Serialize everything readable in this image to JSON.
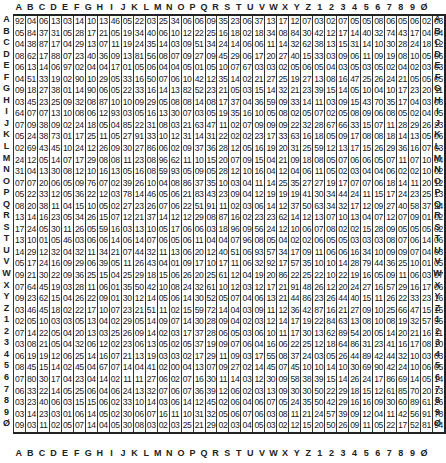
{
  "labels": [
    "A",
    "B",
    "C",
    "D",
    "E",
    "F",
    "G",
    "H",
    "I",
    "J",
    "K",
    "L",
    "M",
    "N",
    "O",
    "P",
    "Q",
    "R",
    "S",
    "T",
    "U",
    "V",
    "W",
    "X",
    "Y",
    "Z",
    "1",
    "2",
    "3",
    "4",
    "5",
    "6",
    "7",
    "8",
    "9",
    "Ø"
  ],
  "rows": [
    [
      "92",
      "04",
      "06",
      "13",
      "03",
      "14",
      "10",
      "13",
      "46",
      "05",
      "22",
      "03",
      "25",
      "34",
      "06",
      "06",
      "09",
      "35",
      "23",
      "06",
      "37",
      "13",
      "17",
      "12",
      "07",
      "03",
      "02",
      "07",
      "05",
      "05",
      "08",
      "06",
      "05",
      "06",
      "02",
      "03"
    ],
    [
      "05",
      "84",
      "37",
      "31",
      "05",
      "28",
      "17",
      "21",
      "05",
      "19",
      "34",
      "40",
      "06",
      "10",
      "12",
      "22",
      "25",
      "16",
      "18",
      "02",
      "18",
      "34",
      "08",
      "84",
      "30",
      "42",
      "12",
      "17",
      "14",
      "40",
      "32",
      "74",
      "43",
      "17",
      "04",
      "04"
    ],
    [
      "04",
      "38",
      "87",
      "17",
      "04",
      "29",
      "13",
      "07",
      "11",
      "19",
      "24",
      "35",
      "14",
      "03",
      "09",
      "51",
      "34",
      "24",
      "14",
      "06",
      "06",
      "11",
      "14",
      "32",
      "62",
      "38",
      "13",
      "15",
      "31",
      "14",
      "10",
      "30",
      "28",
      "24",
      "18",
      "12"
    ],
    [
      "08",
      "62",
      "17",
      "88",
      "07",
      "23",
      "40",
      "36",
      "09",
      "13",
      "81",
      "56",
      "08",
      "07",
      "09",
      "27",
      "09",
      "45",
      "29",
      "06",
      "17",
      "20",
      "27",
      "40",
      "15",
      "33",
      "03",
      "09",
      "06",
      "11",
      "09",
      "19",
      "08",
      "10",
      "05",
      "06"
    ],
    [
      "06",
      "13",
      "14",
      "06",
      "97",
      "02",
      "04",
      "04",
      "17",
      "01",
      "05",
      "06",
      "04",
      "04",
      "05",
      "01",
      "05",
      "10",
      "07",
      "67",
      "03",
      "03",
      "02",
      "05",
      "06",
      "05",
      "04",
      "03",
      "05",
      "03",
      "05",
      "02",
      "04",
      "02",
      "03",
      "03"
    ],
    [
      "04",
      "51",
      "33",
      "19",
      "02",
      "90",
      "10",
      "29",
      "05",
      "33",
      "16",
      "50",
      "07",
      "06",
      "10",
      "42",
      "12",
      "35",
      "14",
      "02",
      "21",
      "27",
      "25",
      "19",
      "27",
      "13",
      "08",
      "16",
      "47",
      "25",
      "26",
      "24",
      "21",
      "05",
      "05",
      "05"
    ],
    [
      "09",
      "18",
      "27",
      "38",
      "01",
      "14",
      "90",
      "06",
      "05",
      "22",
      "33",
      "16",
      "14",
      "13",
      "82",
      "52",
      "23",
      "21",
      "05",
      "03",
      "15",
      "14",
      "32",
      "21",
      "23",
      "39",
      "15",
      "14",
      "05",
      "10",
      "04",
      "10",
      "17",
      "23",
      "20",
      "11"
    ],
    [
      "03",
      "45",
      "23",
      "25",
      "09",
      "32",
      "08",
      "87",
      "10",
      "10",
      "09",
      "29",
      "05",
      "08",
      "08",
      "14",
      "08",
      "17",
      "37",
      "04",
      "36",
      "59",
      "09",
      "33",
      "14",
      "11",
      "03",
      "09",
      "15",
      "43",
      "70",
      "35",
      "17",
      "04",
      "03",
      "03"
    ],
    [
      "64",
      "07",
      "07",
      "13",
      "10",
      "08",
      "06",
      "12",
      "93",
      "03",
      "05",
      "16",
      "13",
      "30",
      "07",
      "03",
      "05",
      "19",
      "35",
      "16",
      "10",
      "05",
      "08",
      "02",
      "05",
      "07",
      "02",
      "05",
      "08",
      "09",
      "06",
      "08",
      "05",
      "02",
      "04",
      "05"
    ],
    [
      "07",
      "09",
      "38",
      "09",
      "02",
      "24",
      "18",
      "05",
      "04",
      "85",
      "22",
      "31",
      "08",
      "03",
      "21",
      "63",
      "47",
      "11",
      "02",
      "07",
      "09",
      "09",
      "09",
      "22",
      "32",
      "28",
      "67",
      "66",
      "33",
      "15",
      "07",
      "11",
      "28",
      "29",
      "26",
      "23"
    ],
    [
      "05",
      "24",
      "38",
      "73",
      "01",
      "17",
      "25",
      "11",
      "05",
      "27",
      "91",
      "33",
      "10",
      "12",
      "31",
      "14",
      "31",
      "22",
      "02",
      "02",
      "23",
      "17",
      "33",
      "63",
      "16",
      "18",
      "05",
      "09",
      "17",
      "08",
      "08",
      "18",
      "14",
      "13",
      "05",
      "06"
    ],
    [
      "02",
      "69",
      "43",
      "45",
      "10",
      "24",
      "12",
      "26",
      "09",
      "30",
      "27",
      "86",
      "06",
      "02",
      "09",
      "37",
      "36",
      "28",
      "12",
      "05",
      "16",
      "19",
      "20",
      "31",
      "25",
      "59",
      "12",
      "13",
      "17",
      "15",
      "26",
      "29",
      "36",
      "16",
      "07",
      "03"
    ],
    [
      "24",
      "12",
      "05",
      "14",
      "07",
      "17",
      "29",
      "08",
      "08",
      "11",
      "23",
      "08",
      "96",
      "62",
      "11",
      "10",
      "15",
      "20",
      "07",
      "09",
      "15",
      "04",
      "21",
      "09",
      "18",
      "08",
      "05",
      "07",
      "06",
      "06",
      "05",
      "07",
      "11",
      "07",
      "10",
      "04"
    ],
    [
      "31",
      "04",
      "13",
      "30",
      "08",
      "12",
      "10",
      "16",
      "13",
      "05",
      "16",
      "08",
      "59",
      "93",
      "05",
      "09",
      "05",
      "28",
      "12",
      "10",
      "16",
      "04",
      "12",
      "04",
      "06",
      "11",
      "05",
      "02",
      "03",
      "04",
      "04",
      "06",
      "02",
      "02",
      "10",
      "02"
    ],
    [
      "07",
      "07",
      "20",
      "06",
      "05",
      "09",
      "76",
      "07",
      "02",
      "39",
      "26",
      "10",
      "04",
      "08",
      "86",
      "37",
      "35",
      "10",
      "03",
      "04",
      "11",
      "14",
      "25",
      "35",
      "27",
      "27",
      "19",
      "17",
      "07",
      "07",
      "06",
      "18",
      "14",
      "11",
      "20",
      "12"
    ],
    [
      "05",
      "22",
      "33",
      "12",
      "05",
      "36",
      "22",
      "12",
      "03",
      "78",
      "14",
      "46",
      "05",
      "06",
      "21",
      "83",
      "43",
      "23",
      "09",
      "04",
      "12",
      "19",
      "19",
      "19",
      "41",
      "30",
      "34",
      "44",
      "24",
      "11",
      "15",
      "17",
      "24",
      "23",
      "25",
      "13"
    ],
    [
      "08",
      "20",
      "38",
      "11",
      "04",
      "15",
      "10",
      "05",
      "02",
      "27",
      "23",
      "26",
      "07",
      "06",
      "22",
      "51",
      "91",
      "11",
      "02",
      "03",
      "06",
      "14",
      "12",
      "37",
      "50",
      "63",
      "34",
      "32",
      "17",
      "12",
      "09",
      "27",
      "40",
      "58",
      "37",
      "24"
    ],
    [
      "13",
      "14",
      "16",
      "23",
      "05",
      "34",
      "26",
      "15",
      "07",
      "12",
      "21",
      "37",
      "14",
      "12",
      "12",
      "29",
      "08",
      "87",
      "16",
      "02",
      "23",
      "23",
      "62",
      "14",
      "12",
      "13",
      "07",
      "10",
      "13",
      "04",
      "07",
      "12",
      "07",
      "09",
      "01",
      "02"
    ],
    [
      "17",
      "24",
      "05",
      "30",
      "11",
      "26",
      "05",
      "59",
      "16",
      "03",
      "13",
      "10",
      "05",
      "17",
      "06",
      "06",
      "03",
      "18",
      "96",
      "09",
      "56",
      "24",
      "12",
      "10",
      "06",
      "07",
      "08",
      "02",
      "02",
      "15",
      "28",
      "09",
      "05",
      "05",
      "05",
      "02"
    ],
    [
      "13",
      "10",
      "01",
      "05",
      "46",
      "03",
      "06",
      "06",
      "14",
      "06",
      "14",
      "07",
      "06",
      "05",
      "06",
      "11",
      "04",
      "04",
      "07",
      "96",
      "08",
      "05",
      "04",
      "02",
      "02",
      "06",
      "05",
      "05",
      "03",
      "03",
      "03",
      "08",
      "07",
      "06",
      "14",
      "06"
    ],
    [
      "14",
      "29",
      "12",
      "32",
      "04",
      "32",
      "11",
      "34",
      "21",
      "07",
      "44",
      "32",
      "11",
      "13",
      "06",
      "20",
      "12",
      "40",
      "51",
      "06",
      "93",
      "57",
      "34",
      "17",
      "09",
      "11",
      "06",
      "06",
      "16",
      "34",
      "10",
      "09",
      "09",
      "07",
      "04",
      "03"
    ],
    [
      "05",
      "17",
      "24",
      "16",
      "09",
      "29",
      "06",
      "39",
      "05",
      "11",
      "26",
      "43",
      "04",
      "01",
      "09",
      "17",
      "10",
      "17",
      "11",
      "06",
      "32",
      "92",
      "17",
      "57",
      "35",
      "10",
      "10",
      "14",
      "28",
      "79",
      "44",
      "36",
      "25",
      "10",
      "01",
      "05"
    ],
    [
      "09",
      "21",
      "30",
      "22",
      "09",
      "36",
      "25",
      "15",
      "04",
      "25",
      "29",
      "18",
      "15",
      "06",
      "26",
      "20",
      "25",
      "61",
      "12",
      "04",
      "19",
      "20",
      "86",
      "22",
      "25",
      "22",
      "10",
      "22",
      "19",
      "16",
      "05",
      "09",
      "11",
      "06",
      "03",
      "07"
    ],
    [
      "07",
      "64",
      "45",
      "19",
      "03",
      "28",
      "11",
      "06",
      "01",
      "35",
      "50",
      "42",
      "10",
      "08",
      "24",
      "32",
      "61",
      "10",
      "12",
      "03",
      "12",
      "17",
      "21",
      "91",
      "48",
      "26",
      "12",
      "20",
      "24",
      "27",
      "16",
      "57",
      "29",
      "16",
      "17",
      "06"
    ],
    [
      "09",
      "23",
      "62",
      "15",
      "04",
      "26",
      "22",
      "09",
      "01",
      "30",
      "12",
      "14",
      "05",
      "06",
      "14",
      "30",
      "52",
      "05",
      "07",
      "04",
      "06",
      "13",
      "21",
      "44",
      "86",
      "23",
      "26",
      "44",
      "40",
      "15",
      "11",
      "26",
      "22",
      "33",
      "23",
      "16"
    ],
    [
      "03",
      "46",
      "45",
      "18",
      "02",
      "22",
      "17",
      "10",
      "07",
      "23",
      "21",
      "51",
      "11",
      "02",
      "15",
      "59",
      "72",
      "14",
      "04",
      "03",
      "09",
      "11",
      "12",
      "36",
      "42",
      "87",
      "16",
      "21",
      "27",
      "09",
      "10",
      "25",
      "66",
      "47",
      "15",
      "15"
    ],
    [
      "02",
      "05",
      "10",
      "03",
      "03",
      "05",
      "13",
      "04",
      "02",
      "29",
      "05",
      "14",
      "09",
      "07",
      "14",
      "30",
      "28",
      "09",
      "04",
      "02",
      "03",
      "12",
      "14",
      "17",
      "19",
      "22",
      "84",
      "63",
      "13",
      "08",
      "10",
      "08",
      "19",
      "32",
      "57",
      "55"
    ],
    [
      "07",
      "14",
      "22",
      "05",
      "04",
      "20",
      "13",
      "03",
      "25",
      "26",
      "09",
      "14",
      "02",
      "03",
      "17",
      "37",
      "28",
      "06",
      "05",
      "03",
      "06",
      "10",
      "11",
      "17",
      "30",
      "13",
      "62",
      "89",
      "54",
      "20",
      "05",
      "14",
      "20",
      "21",
      "16",
      "11"
    ],
    [
      "03",
      "08",
      "21",
      "05",
      "04",
      "32",
      "06",
      "12",
      "02",
      "23",
      "06",
      "13",
      "05",
      "02",
      "05",
      "37",
      "19",
      "09",
      "07",
      "06",
      "04",
      "16",
      "06",
      "22",
      "25",
      "12",
      "18",
      "64",
      "86",
      "31",
      "23",
      "41",
      "16",
      "17",
      "08",
      "10"
    ],
    [
      "06",
      "19",
      "19",
      "12",
      "06",
      "25",
      "14",
      "16",
      "07",
      "21",
      "13",
      "19",
      "03",
      "03",
      "02",
      "17",
      "29",
      "11",
      "09",
      "03",
      "17",
      "55",
      "08",
      "37",
      "24",
      "03",
      "05",
      "26",
      "44",
      "89",
      "42",
      "44",
      "32",
      "10",
      "03",
      "03"
    ],
    [
      "08",
      "45",
      "15",
      "14",
      "02",
      "45",
      "04",
      "67",
      "07",
      "14",
      "04",
      "41",
      "02",
      "00",
      "04",
      "13",
      "07",
      "09",
      "27",
      "02",
      "14",
      "45",
      "07",
      "45",
      "10",
      "10",
      "14",
      "10",
      "30",
      "69",
      "90",
      "42",
      "24",
      "10",
      "06",
      "05"
    ],
    [
      "07",
      "80",
      "30",
      "17",
      "04",
      "23",
      "04",
      "14",
      "02",
      "11",
      "11",
      "27",
      "06",
      "02",
      "07",
      "16",
      "30",
      "11",
      "14",
      "03",
      "12",
      "30",
      "09",
      "58",
      "38",
      "39",
      "15",
      "14",
      "26",
      "24",
      "17",
      "86",
      "69",
      "14",
      "05",
      "14"
    ],
    [
      "06",
      "33",
      "22",
      "14",
      "05",
      "25",
      "06",
      "04",
      "06",
      "24",
      "13",
      "32",
      "07",
      "06",
      "07",
      "36",
      "39",
      "12",
      "06",
      "02",
      "03",
      "13",
      "09",
      "30",
      "30",
      "50",
      "22",
      "29",
      "18",
      "15",
      "12",
      "61",
      "85",
      "70",
      "20",
      "13"
    ],
    [
      "03",
      "23",
      "40",
      "06",
      "03",
      "15",
      "15",
      "06",
      "02",
      "33",
      "10",
      "14",
      "03",
      "06",
      "14",
      "12",
      "45",
      "02",
      "06",
      "04",
      "06",
      "07",
      "05",
      "24",
      "35",
      "50",
      "42",
      "29",
      "16",
      "16",
      "09",
      "30",
      "60",
      "89",
      "61",
      "26"
    ],
    [
      "03",
      "14",
      "23",
      "03",
      "01",
      "06",
      "14",
      "05",
      "02",
      "30",
      "06",
      "07",
      "16",
      "11",
      "10",
      "31",
      "32",
      "05",
      "06",
      "07",
      "06",
      "03",
      "08",
      "11",
      "21",
      "24",
      "57",
      "39",
      "09",
      "12",
      "04",
      "11",
      "42",
      "56",
      "91",
      "78"
    ],
    [
      "09",
      "03",
      "11",
      "02",
      "05",
      "07",
      "14",
      "04",
      "05",
      "30",
      "08",
      "03",
      "02",
      "03",
      "25",
      "21",
      "29",
      "02",
      "03",
      "04",
      "05",
      "03",
      "02",
      "12",
      "15",
      "20",
      "50",
      "26",
      "09",
      "11",
      "05",
      "22",
      "17",
      "52",
      "81",
      "94"
    ]
  ]
}
